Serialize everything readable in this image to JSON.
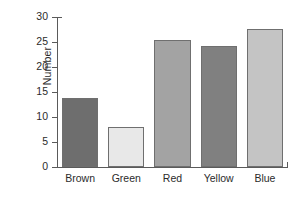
{
  "chart_data": {
    "type": "bar",
    "title": "",
    "subtitle": "",
    "xlabel": "",
    "ylabel": "Number",
    "categories": [
      "Brown",
      "Green",
      "Red",
      "Yellow",
      "Blue"
    ],
    "values": [
      13.9,
      8.1,
      25.4,
      24.2,
      27.7
    ],
    "series": [
      {
        "name": "Number",
        "values": [
          13.9,
          8.1,
          25.4,
          24.2,
          27.7
        ]
      }
    ],
    "bar_colors": [
      "#6e6e6e",
      "#e8e8e8",
      "#a3a3a3",
      "#808080",
      "#c4c4c4"
    ],
    "bar_outline_color": "#6f6f6f",
    "ylim": [
      0,
      30
    ],
    "ytick_values": [
      0,
      5,
      10,
      15,
      20,
      25,
      30
    ],
    "ytick_labels": [
      "0",
      "5",
      "10",
      "15",
      "20",
      "25",
      "30"
    ],
    "grid": false,
    "legend": false,
    "legend_position": "none",
    "axis_color": "#5a5a5a",
    "background_color": "#ffffff",
    "text_color": "#2b2b2b"
  }
}
